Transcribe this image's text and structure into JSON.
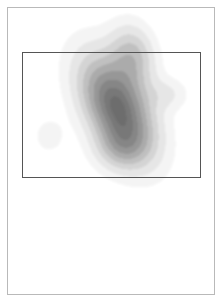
{
  "figure": {
    "background_color": "#ffffff",
    "outer_frame": {
      "name": "page-border",
      "x": 7,
      "y": 7,
      "width": 208,
      "height": 288,
      "stroke_color": "#b9b9b9",
      "stroke_width": 1
    },
    "roi_rectangle": {
      "name": "region-of-interest-box",
      "x": 22,
      "y": 52,
      "width": 179,
      "height": 126,
      "stroke_color": "#555555",
      "stroke_width": 1.4,
      "fill": "none"
    }
  },
  "chart_data": {
    "type": "heatmap",
    "subtype": "kde-density-contour",
    "title": "",
    "subtitle": "",
    "xlabel": "",
    "ylabel": "",
    "xlim": [
      0,
      206
    ],
    "ylim": [
      0,
      286
    ],
    "grid": false,
    "legend": null,
    "axes_visible": false,
    "tick_labels_x": [],
    "tick_labels_y": [],
    "colormap": {
      "name": "grays",
      "reversed": true,
      "levels": [
        {
          "level": 1,
          "value": 0.08,
          "color": "#f4f4f4"
        },
        {
          "level": 2,
          "value": 0.18,
          "color": "#e6e6e6"
        },
        {
          "level": 3,
          "value": 0.3,
          "color": "#d4d4d4"
        },
        {
          "level": 4,
          "value": 0.42,
          "color": "#c0c0c0"
        },
        {
          "level": 5,
          "value": 0.54,
          "color": "#ababab"
        },
        {
          "level": 6,
          "value": 0.66,
          "color": "#979797"
        },
        {
          "level": 7,
          "value": 0.78,
          "color": "#868686"
        },
        {
          "level": 8,
          "value": 0.88,
          "color": "#787878"
        },
        {
          "level": 9,
          "value": 0.96,
          "color": "#6d6d6d"
        },
        {
          "level": 10,
          "value": 1.0,
          "color": "#666666"
        }
      ]
    },
    "peaks": [
      {
        "name": "primary-peak",
        "x": 117,
        "y": 107,
        "amplitude": 1.0,
        "sigma_x": 21,
        "sigma_y": 38,
        "rotation_deg": -28,
        "description": "main elongated density lobe oriented NE-SW"
      },
      {
        "name": "upper-extension",
        "x": 133,
        "y": 55,
        "amplitude": 0.42,
        "sigma_x": 15,
        "sigma_y": 22,
        "rotation_deg": -12,
        "description": "faint plume extending above the ROI top edge"
      },
      {
        "name": "right-lobe",
        "x": 168,
        "y": 94,
        "amplitude": 0.17,
        "sigma_x": 14,
        "sigma_y": 11,
        "rotation_deg": 0,
        "description": "faint secondary lobe on the right side"
      },
      {
        "name": "lower-left-blob",
        "x": 49,
        "y": 136,
        "amplitude": 0.13,
        "sigma_x": 11,
        "sigma_y": 13,
        "rotation_deg": 0,
        "description": "small faint isolated blob lower-left of main peak"
      },
      {
        "name": "lower-tail",
        "x": 121,
        "y": 148,
        "amplitude": 0.3,
        "sigma_x": 18,
        "sigma_y": 16,
        "rotation_deg": 0,
        "description": "broad low tail below the primary peak"
      }
    ],
    "annotations": []
  }
}
